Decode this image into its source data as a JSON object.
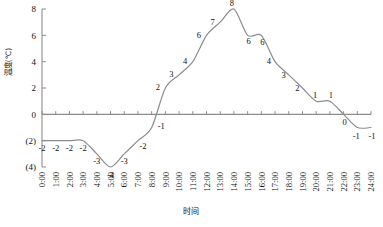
{
  "chart_data": {
    "type": "line",
    "title": "",
    "xlabel": "时间",
    "ylabel": "温度(℃)",
    "ylim": [
      -4,
      8
    ],
    "grid": false,
    "legend": "none",
    "line_color": "#8c8c8c",
    "axis_color": "#8c8c8c",
    "y_ticks": [
      8,
      6,
      4,
      2,
      0,
      -2,
      -4
    ],
    "y_tick_labels": [
      "8",
      "6",
      "4",
      "2",
      "0",
      "(2)",
      "(4)"
    ],
    "categories": [
      "0:00",
      "1:00",
      "2:00",
      "3:00",
      "4:00",
      "5:00",
      "6:00",
      "7:00",
      "8:00",
      "9:00",
      "10:00",
      "11:00",
      "12:00",
      "13:00",
      "14:00",
      "15:00",
      "16:00",
      "17:00",
      "18:00",
      "19:00",
      "20:00",
      "21:00",
      "22:00",
      "23:00",
      "24:00"
    ],
    "values": [
      -2,
      -2,
      -2,
      -2,
      -3,
      -4,
      -3,
      -2,
      -1,
      2,
      3,
      4,
      6,
      7,
      8,
      6,
      6,
      4,
      3,
      2,
      1,
      1,
      0,
      -1,
      -1
    ],
    "point_labels": [
      "-2",
      "-2",
      "-2",
      "-2",
      "-3",
      "-4",
      "-3",
      "-2",
      "-1",
      "2",
      "3",
      "4",
      "6",
      "7",
      "8",
      "6",
      "6",
      "4",
      "3",
      "2",
      "1",
      "1",
      "0",
      "-1",
      "-1"
    ]
  },
  "meta": {
    "y_axis_label_note": "温度(℃)",
    "x_axis_label_note": "时间"
  }
}
